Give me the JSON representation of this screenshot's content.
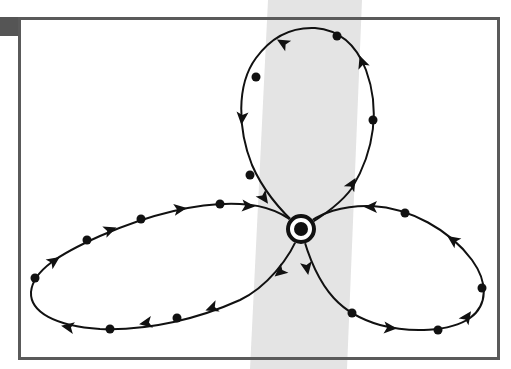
{
  "figure": {
    "type": "three-lobed orbit diagram",
    "colors": {
      "stroke": "#111111",
      "frame": "#5a5a5a",
      "band": "#e6e6e6",
      "corner_block": "#555555",
      "background": "#ffffff"
    },
    "center_node": {
      "x": 301,
      "y": 229,
      "ring_radius": 13,
      "dot_radius": 7,
      "symbol": "circled-dot"
    },
    "lobes": [
      {
        "name": "top",
        "path": "M301,229 C285,215 265,195 252,165 C238,130 236,85 256,58 C272,36 292,27 315,28 C340,30 356,44 366,70 C380,108 375,150 352,188 C340,205 320,218 301,229",
        "dots": [
          [
            337,
            36
          ],
          [
            256,
            77
          ],
          [
            373,
            120
          ],
          [
            250,
            175
          ]
        ],
        "arrows": [
          {
            "x": 283,
            "y": 43,
            "angle": -150
          },
          {
            "x": 242,
            "y": 118,
            "angle": 95
          },
          {
            "x": 264,
            "y": 198,
            "angle": 55
          },
          {
            "x": 362,
            "y": 62,
            "angle": -110
          },
          {
            "x": 352,
            "y": 184,
            "angle": -60
          }
        ]
      },
      {
        "name": "left",
        "path": "M301,229 C285,212 265,205 240,204 C200,202 150,214 100,236 C60,254 33,270 31,292 C30,312 55,326 100,329 C150,331 200,318 240,300 C265,288 290,260 301,229",
        "dots": [
          [
            35,
            278
          ],
          [
            87,
            240
          ],
          [
            141,
            219
          ],
          [
            220,
            204
          ],
          [
            110,
            329
          ],
          [
            177,
            318
          ]
        ],
        "arrows": [
          {
            "x": 54,
            "y": 261,
            "angle": -35
          },
          {
            "x": 110,
            "y": 230,
            "angle": -20
          },
          {
            "x": 180,
            "y": 209,
            "angle": -8
          },
          {
            "x": 248,
            "y": 206,
            "angle": 5
          },
          {
            "x": 280,
            "y": 272,
            "angle": 140
          },
          {
            "x": 212,
            "y": 308,
            "angle": 160
          },
          {
            "x": 146,
            "y": 323,
            "angle": 170
          },
          {
            "x": 68,
            "y": 327,
            "angle": -170
          }
        ]
      },
      {
        "name": "right",
        "path": "M301,229 C318,212 345,205 372,206 C410,208 450,230 472,260 C488,282 488,305 470,318 C450,332 410,333 380,325 C345,315 318,295 301,229",
        "dots": [
          [
            405,
            213
          ],
          [
            482,
            288
          ],
          [
            438,
            330
          ],
          [
            352,
            313
          ]
        ],
        "arrows": [
          {
            "x": 371,
            "y": 207,
            "angle": 180
          },
          {
            "x": 453,
            "y": 240,
            "angle": -145
          },
          {
            "x": 467,
            "y": 317,
            "angle": -55
          },
          {
            "x": 390,
            "y": 328,
            "angle": 5
          },
          {
            "x": 307,
            "y": 268,
            "angle": 80
          }
        ]
      }
    ]
  }
}
